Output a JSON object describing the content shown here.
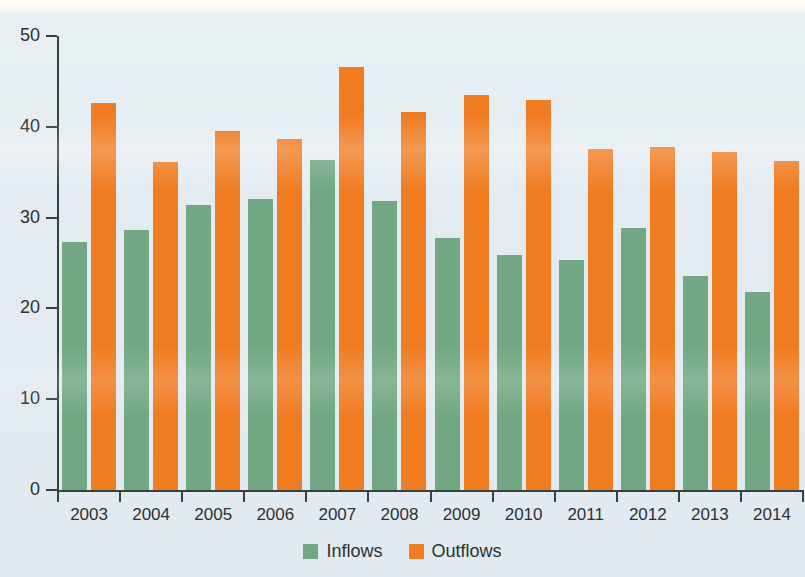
{
  "chart_data": {
    "type": "bar",
    "title": "",
    "xlabel": "",
    "ylabel": "",
    "categories": [
      "2003",
      "2004",
      "2005",
      "2006",
      "2007",
      "2008",
      "2009",
      "2010",
      "2011",
      "2012",
      "2013",
      "2014"
    ],
    "series": [
      {
        "name": "Inflows",
        "color": "#71a883",
        "values": [
          27.3,
          28.6,
          31.4,
          32.0,
          36.4,
          31.8,
          27.7,
          25.9,
          25.3,
          28.9,
          23.6,
          21.8
        ]
      },
      {
        "name": "Outflows",
        "color": "#f07c22",
        "values": [
          42.6,
          36.1,
          39.5,
          38.7,
          46.6,
          41.6,
          43.5,
          42.9,
          37.6,
          37.8,
          37.2,
          36.2
        ]
      }
    ],
    "ylim": [
      0,
      50
    ],
    "ytick_labels": [
      "0",
      "10",
      "20",
      "30",
      "40",
      "50"
    ],
    "ytick_values": [
      0,
      10,
      20,
      30,
      40,
      50
    ],
    "grid": false,
    "legend_position": "bottom-center"
  },
  "legend": {
    "items": [
      {
        "label": "Inflows",
        "swatch": "inflows-swatch",
        "color": "#71a883"
      },
      {
        "label": "Outflows",
        "swatch": "outflows-swatch",
        "color": "#f07c22"
      }
    ]
  },
  "colors": {
    "background": "#e3ebf1",
    "axis": "#3a3f42",
    "text": "#2d3134",
    "inflows": "#71a883",
    "outflows": "#f07c22"
  }
}
